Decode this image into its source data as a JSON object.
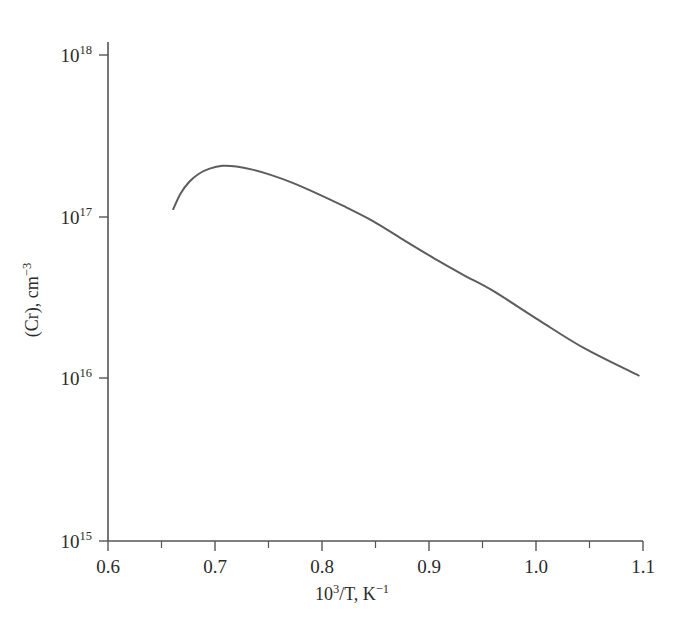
{
  "chart_data": {
    "type": "line",
    "title": "",
    "xlabel": "10^3/T, K^-1",
    "ylabel": "(Cr), cm^-3",
    "xlabel_parts": {
      "base": "10",
      "exp": "3",
      "mid": "/T, K",
      "exp2": "−1"
    },
    "ylabel_parts": {
      "base": "(Cr), cm",
      "exp": "−3"
    },
    "xscale": "linear",
    "yscale": "log",
    "xlim": [
      0.6,
      1.1
    ],
    "ylim": [
      1000000000000000.0,
      1e+18
    ],
    "grid": false,
    "legend": null,
    "x_ticks": [
      0.6,
      0.7,
      0.8,
      0.9,
      1.0,
      1.1
    ],
    "x_tick_labels": [
      "0.6",
      "0.7",
      "0.8",
      "0.9",
      "1.0",
      "1.1"
    ],
    "x_minor_ticks": [
      0.65,
      0.75,
      0.85,
      0.95,
      1.05
    ],
    "y_ticks": [
      1000000000000000.0,
      1e+16,
      1e+17,
      1e+18
    ],
    "y_tick_labels": [
      "10^15",
      "10^16",
      "10^17",
      "10^18"
    ],
    "y_tick_mantissa": "10",
    "y_tick_exponents": [
      "15",
      "16",
      "17",
      "18"
    ],
    "series": [
      {
        "name": "Cr solubility",
        "color": "#5d5d5d",
        "x": [
          0.661,
          0.668,
          0.676,
          0.685,
          0.695,
          0.707,
          0.72,
          0.735,
          0.752,
          0.772,
          0.795,
          0.82,
          0.848,
          0.875,
          0.904,
          0.932,
          0.96,
          1.003,
          1.045,
          1.096
        ],
        "y": [
          1.12e+17,
          1.4e+17,
          1.65e+17,
          1.85e+17,
          1.99e+17,
          2.07e+17,
          2.05e+17,
          1.96e+17,
          1.82e+17,
          1.63e+17,
          1.4e+17,
          1.17e+17,
          9.4e+16,
          7.3e+16,
          5.6e+16,
          4.4e+16,
          3.5e+16,
          2.3e+16,
          1.55e+16,
          1.05e+16
        ]
      }
    ]
  },
  "figure": {
    "caption": "",
    "background": "#ffffff",
    "axis_color": "#555555"
  }
}
